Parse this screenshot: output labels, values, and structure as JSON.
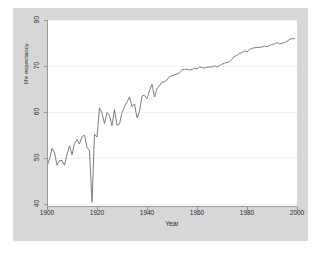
{
  "chart_data": {
    "type": "line",
    "title": "",
    "xlabel": "Year",
    "ylabel": "life expectancy",
    "xlim": [
      1900,
      2000
    ],
    "ylim": [
      38,
      81
    ],
    "xticks": [
      1900,
      1920,
      1940,
      1960,
      1980,
      2000
    ],
    "yticks": [
      40,
      50,
      60,
      70,
      80
    ],
    "grid": "horizontal",
    "legend": "none",
    "line_color": "#6e6e6e",
    "plot_background": "#ffffff",
    "graph_background": "#d7d7d7",
    "series": [
      {
        "name": "life expectancy",
        "x": [
          1900,
          1901,
          1902,
          1903,
          1904,
          1905,
          1906,
          1907,
          1908,
          1909,
          1910,
          1911,
          1912,
          1913,
          1914,
          1915,
          1916,
          1917,
          1918,
          1919,
          1920,
          1921,
          1922,
          1923,
          1924,
          1925,
          1926,
          1927,
          1928,
          1929,
          1930,
          1931,
          1932,
          1933,
          1934,
          1935,
          1936,
          1937,
          1938,
          1939,
          1940,
          1941,
          1942,
          1943,
          1944,
          1945,
          1946,
          1947,
          1948,
          1949,
          1950,
          1951,
          1952,
          1953,
          1954,
          1955,
          1956,
          1957,
          1958,
          1959,
          1960,
          1961,
          1962,
          1963,
          1964,
          1965,
          1966,
          1967,
          1968,
          1969,
          1970,
          1971,
          1972,
          1973,
          1974,
          1975,
          1976,
          1977,
          1978,
          1979,
          1980,
          1981,
          1982,
          1983,
          1984,
          1985,
          1986,
          1987,
          1988,
          1989,
          1990,
          1991,
          1992,
          1993,
          1994,
          1995,
          1996,
          1997,
          1998,
          1999
        ],
        "values": [
          47.3,
          49.1,
          51.5,
          50.5,
          47.6,
          48.7,
          48.7,
          47.6,
          50.1,
          52.1,
          50.0,
          52.6,
          53.5,
          52.5,
          54.2,
          54.5,
          51.7,
          50.9,
          39.1,
          54.7,
          54.1,
          60.8,
          59.6,
          57.2,
          59.7,
          59.0,
          56.7,
          60.4,
          56.8,
          57.1,
          59.7,
          61.1,
          62.1,
          63.3,
          61.1,
          61.7,
          58.5,
          60.0,
          63.5,
          63.7,
          62.9,
          64.8,
          66.2,
          63.3,
          65.2,
          65.9,
          66.7,
          66.8,
          67.2,
          68.0,
          68.2,
          68.4,
          68.6,
          68.8,
          69.6,
          69.6,
          69.7,
          69.5,
          69.6,
          69.9,
          69.7,
          70.2,
          70.1,
          69.9,
          70.2,
          70.2,
          70.2,
          70.5,
          70.2,
          70.5,
          70.8,
          71.1,
          71.2,
          71.4,
          72.0,
          72.6,
          72.9,
          73.3,
          73.5,
          73.9,
          73.7,
          74.2,
          74.5,
          74.6,
          74.7,
          74.7,
          74.8,
          75.0,
          74.9,
          75.1,
          75.4,
          75.5,
          75.8,
          75.5,
          75.7,
          75.8,
          76.1,
          76.5,
          76.7,
          76.7
        ]
      }
    ]
  },
  "axes": {
    "ytick_labels": [
      "40",
      "50",
      "60",
      "70",
      "80"
    ],
    "xtick_labels": [
      "1900",
      "1920",
      "1940",
      "1960",
      "1980",
      "2000"
    ],
    "y_title": "life expectancy",
    "x_title": "Year"
  }
}
